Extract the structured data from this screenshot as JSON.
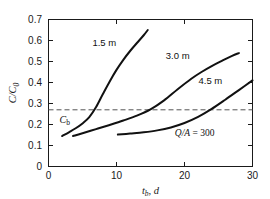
{
  "chart_data": {
    "type": "line",
    "title": "",
    "xlabel": "t_b, d",
    "xlabel_main": "t",
    "xlabel_sub": "b",
    "xlabel_rest": ", d",
    "ylabel": "C/C_0",
    "ylabel_main": "C/C",
    "ylabel_sub": "0",
    "xlim": [
      0,
      30
    ],
    "ylim": [
      0,
      0.7
    ],
    "xticks": [
      0,
      10,
      20,
      30
    ],
    "xtick_labels": [
      "0",
      "10",
      "20",
      "30"
    ],
    "yticks": [
      0,
      0.1,
      0.2,
      0.3,
      0.4,
      0.5,
      0.6,
      0.7
    ],
    "ytick_labels": [
      "0",
      "0.1",
      "0.2",
      "0.3",
      "0.4",
      "0.5",
      "0.6",
      "0.7"
    ],
    "grid": false,
    "legend": "inline-curve-labels",
    "line_color": "#111111",
    "threshold": {
      "name": "C_b",
      "label_main": "C",
      "label_sub": "b",
      "value": 0.27,
      "style": "dashed",
      "color": "#555555"
    },
    "annotations": [
      {
        "name": "flux-annotation",
        "text": "Q/A = 300",
        "x": 21.5,
        "y": 0.145
      }
    ],
    "series": [
      {
        "name": "1.5 m",
        "label": "1.5 m",
        "label_x": 8.2,
        "label_y": 0.575,
        "points": [
          [
            2.0,
            0.145
          ],
          [
            3.0,
            0.163
          ],
          [
            4.0,
            0.182
          ],
          [
            5.0,
            0.205
          ],
          [
            6.0,
            0.235
          ],
          [
            7.0,
            0.283
          ],
          [
            8.0,
            0.345
          ],
          [
            9.0,
            0.405
          ],
          [
            10.0,
            0.46
          ],
          [
            11.0,
            0.508
          ],
          [
            12.0,
            0.55
          ],
          [
            13.0,
            0.588
          ],
          [
            14.0,
            0.625
          ],
          [
            14.6,
            0.65
          ]
        ]
      },
      {
        "name": "3.0 m",
        "label": "3.0 m",
        "label_x": 19.0,
        "label_y": 0.512,
        "points": [
          [
            3.6,
            0.145
          ],
          [
            5.0,
            0.158
          ],
          [
            7.0,
            0.178
          ],
          [
            9.0,
            0.198
          ],
          [
            11.0,
            0.219
          ],
          [
            13.0,
            0.242
          ],
          [
            15.0,
            0.272
          ],
          [
            17.0,
            0.315
          ],
          [
            19.0,
            0.368
          ],
          [
            21.0,
            0.418
          ],
          [
            22.5,
            0.45
          ],
          [
            24.0,
            0.478
          ],
          [
            25.5,
            0.503
          ],
          [
            27.0,
            0.527
          ],
          [
            28.0,
            0.54
          ]
        ]
      },
      {
        "name": "4.5 m",
        "label": "4.5 m",
        "label_x": 23.8,
        "label_y": 0.393,
        "points": [
          [
            10.2,
            0.152
          ],
          [
            12.0,
            0.157
          ],
          [
            14.0,
            0.163
          ],
          [
            16.0,
            0.172
          ],
          [
            18.0,
            0.186
          ],
          [
            20.0,
            0.207
          ],
          [
            22.0,
            0.236
          ],
          [
            24.0,
            0.274
          ],
          [
            26.0,
            0.318
          ],
          [
            28.0,
            0.364
          ],
          [
            30.0,
            0.41
          ]
        ]
      }
    ]
  }
}
